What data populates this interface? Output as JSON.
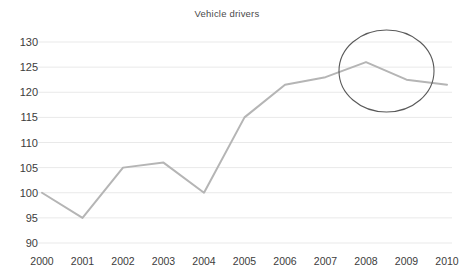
{
  "chart_data": {
    "type": "line",
    "title": "Vehicle drivers",
    "xlabel": "",
    "ylabel": "",
    "categories": [
      "2000",
      "2001",
      "2002",
      "2003",
      "2004",
      "2005",
      "2006",
      "2007",
      "2008",
      "2009",
      "2010"
    ],
    "values": [
      100,
      95,
      105,
      106,
      100,
      115,
      121.5,
      123,
      126,
      122.5,
      121.5
    ],
    "series": [
      {
        "name": "Vehicle drivers",
        "values": [
          100,
          95,
          105,
          106,
          100,
          115,
          121.5,
          123,
          126,
          122.5,
          121.5
        ]
      }
    ],
    "ylim": [
      90,
      130
    ],
    "ytick_step": 5,
    "yticks": [
      90,
      95,
      100,
      105,
      110,
      115,
      120,
      125,
      130
    ],
    "grid": true,
    "grid_axis": "y",
    "legend": "none",
    "annotations": [
      {
        "kind": "ellipse-highlight",
        "label": "highlight-2008-2010",
        "covers": [
          "2008",
          "2009",
          "2010"
        ]
      }
    ]
  },
  "colors": {
    "line": "#b5b5b5",
    "grid": "#e9e9e9",
    "annotation": "#5a5a5a",
    "text": "#3c3c3c",
    "title_text": "#4a4a4a",
    "background": "#ffffff"
  }
}
